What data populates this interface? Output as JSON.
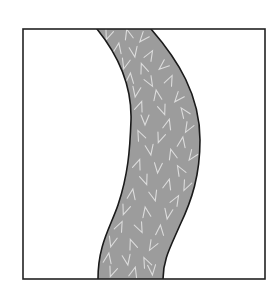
{
  "diagram": {
    "type": "illustration",
    "frame": {
      "x": 23,
      "y": 29,
      "width": 242,
      "height": 250,
      "stroke": "#222222",
      "stroke_width": 1.6,
      "fill": "#ffffff"
    },
    "band": {
      "fill": "#9c9c9c",
      "stroke": "#1a1a1a",
      "stroke_width": 1.6,
      "pattern_stroke": "#dcdcdc",
      "left_edge": "M97,29 C118,55 132,85 131,120 C130,150 128,175 118,205 C110,228 98,245 98,279",
      "right_edge": "M151,29 C178,60 200,95 200,140 C200,175 192,200 180,225 C170,248 163,260 163,279"
    },
    "marks": [
      [
        108,
        35,
        "v",
        20
      ],
      [
        128,
        34,
        "a",
        -15
      ],
      [
        143,
        38,
        "v",
        40
      ],
      [
        118,
        48,
        "a",
        10
      ],
      [
        134,
        52,
        "v",
        -10
      ],
      [
        150,
        55,
        "a",
        30
      ],
      [
        125,
        64,
        "v",
        15
      ],
      [
        143,
        68,
        "a",
        -20
      ],
      [
        163,
        66,
        "v",
        50
      ],
      [
        130,
        78,
        "a",
        5
      ],
      [
        150,
        82,
        "v",
        -30
      ],
      [
        170,
        80,
        "a",
        25
      ],
      [
        136,
        92,
        "v",
        10
      ],
      [
        157,
        95,
        "a",
        -10
      ],
      [
        178,
        98,
        "v",
        40
      ],
      [
        140,
        106,
        "a",
        20
      ],
      [
        163,
        110,
        "v",
        -20
      ],
      [
        184,
        112,
        "a",
        -35
      ],
      [
        145,
        120,
        "v",
        0
      ],
      [
        168,
        124,
        "a",
        15
      ],
      [
        188,
        128,
        "v",
        30
      ],
      [
        140,
        135,
        "a",
        -25
      ],
      [
        160,
        138,
        "v",
        20
      ],
      [
        182,
        142,
        "a",
        10
      ],
      [
        150,
        150,
        "v",
        -10
      ],
      [
        172,
        154,
        "a",
        -15
      ],
      [
        192,
        156,
        "v",
        35
      ],
      [
        138,
        164,
        "a",
        20
      ],
      [
        158,
        168,
        "v",
        5
      ],
      [
        180,
        170,
        "a",
        -30
      ],
      [
        145,
        180,
        "v",
        -20
      ],
      [
        168,
        184,
        "a",
        15
      ],
      [
        186,
        186,
        "v",
        25
      ],
      [
        132,
        194,
        "a",
        10
      ],
      [
        154,
        196,
        "v",
        -15
      ],
      [
        176,
        200,
        "a",
        30
      ],
      [
        125,
        210,
        "v",
        20
      ],
      [
        146,
        212,
        "a",
        -10
      ],
      [
        168,
        214,
        "v",
        10
      ],
      [
        120,
        226,
        "a",
        25
      ],
      [
        140,
        228,
        "v",
        -25
      ],
      [
        160,
        230,
        "a",
        5
      ],
      [
        112,
        242,
        "v",
        15
      ],
      [
        132,
        244,
        "a",
        -20
      ],
      [
        152,
        246,
        "v",
        30
      ],
      [
        108,
        258,
        "a",
        10
      ],
      [
        127,
        260,
        "v",
        -10
      ],
      [
        146,
        262,
        "a",
        -25
      ],
      [
        112,
        272,
        "v",
        20
      ],
      [
        134,
        272,
        "a",
        15
      ],
      [
        152,
        270,
        "v",
        -5
      ]
    ]
  }
}
